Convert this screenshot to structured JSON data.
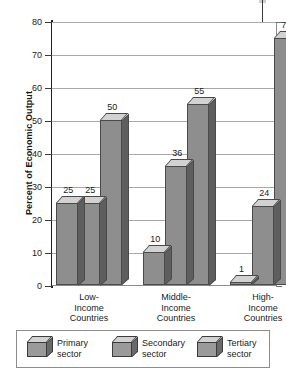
{
  "chart_data": {
    "type": "bar",
    "title": "",
    "xlabel": "",
    "ylabel": "Percent of Economic Output",
    "ylim": [
      0,
      80
    ],
    "ytick_step": 10,
    "yticks": [
      "0",
      "10",
      "20",
      "30",
      "40",
      "50",
      "60",
      "70",
      "80"
    ],
    "grid": true,
    "legend_position": "bottom",
    "categories": [
      "Low-\nIncome\nCountries",
      "Middle-\nIncome\nCountries",
      "High-\nIncome\nCountries"
    ],
    "category_lines": [
      [
        "Low-",
        "Income",
        "Countries"
      ],
      [
        "Middle-",
        "Income",
        "Countries"
      ],
      [
        "High-",
        "Income",
        "Countries"
      ]
    ],
    "series": [
      {
        "name": "Primary sector",
        "values": [
          25,
          10,
          1
        ]
      },
      {
        "name": "Secondary sector",
        "values": [
          25,
          36,
          24
        ]
      },
      {
        "name": "Tertiary sector",
        "values": [
          50,
          55,
          75
        ]
      }
    ],
    "data_labels": [
      {
        "group": "Low-Income Countries",
        "series": "Primary sector",
        "value": 25
      },
      {
        "group": "Low-Income Countries",
        "series": "Secondary sector",
        "value": 25
      },
      {
        "group": "Low-Income Countries",
        "series": "Tertiary sector",
        "value": 50
      },
      {
        "group": "Middle-Income Countries",
        "series": "Primary sector",
        "value": 10
      },
      {
        "group": "Middle-Income Countries",
        "series": "Secondary sector",
        "value": 36
      },
      {
        "group": "Middle-Income Countries",
        "series": "Tertiary sector",
        "value": 55
      },
      {
        "group": "High-Income Countries",
        "series": "Primary sector",
        "value": 1
      },
      {
        "group": "High-Income Countries",
        "series": "Secondary sector",
        "value": 24
      },
      {
        "group": "High-Income Countries",
        "series": "Tertiary sector",
        "value": 75
      }
    ],
    "annotations": [
      {
        "name": "callout-leader-line",
        "target_value": 75,
        "target_group": "High-Income Countries"
      }
    ],
    "colors": {
      "bar_front": "#8e8e8e",
      "bar_top": "#d2d2d2",
      "bar_side": "#5e5e5e",
      "bar_outline": "#4a4a4a",
      "gridline": "#a8a8a8",
      "axis": "#222222",
      "plot_background": "#ffffff",
      "text": "#1a1a1a"
    }
  },
  "legend": {
    "items": [
      {
        "label_line1": "Primary",
        "label_line2": "sector"
      },
      {
        "label_line1": "Secondary",
        "label_line2": "sector"
      },
      {
        "label_line1": "Tertiary",
        "label_line2": "sector"
      }
    ]
  }
}
